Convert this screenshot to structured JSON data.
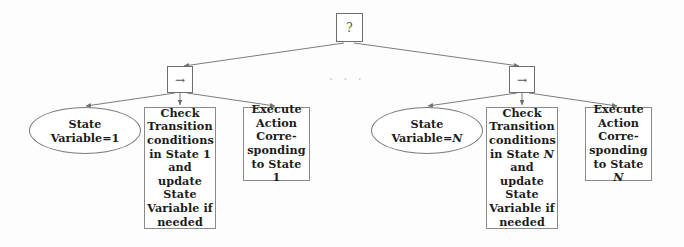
{
  "diagram": {
    "type": "behavior-tree",
    "background_color": "#fdfdfd",
    "line_color": "#6e6e6e",
    "text_color": "#1b1b1b",
    "ellipsis": "· · ·",
    "root": {
      "label": "?",
      "icon": "fallback-question-glyph"
    },
    "sequences": [
      {
        "label": "→",
        "icon": "sequence-arrow-glyph"
      },
      {
        "label": "→",
        "icon": "sequence-arrow-glyph"
      }
    ],
    "branches": [
      {
        "index": "1",
        "condition": {
          "line1": "State",
          "line2": "Variable=1"
        },
        "check": {
          "lines": [
            "Check",
            "Transition",
            "conditions",
            "in State 1",
            "and update",
            "State",
            "Variable if",
            "needed"
          ]
        },
        "execute": {
          "lines": [
            "Execute",
            "Action",
            "Corre-",
            "sponding",
            "to State 1"
          ]
        }
      },
      {
        "index": "N",
        "condition": {
          "line1": "State",
          "line2_prefix": "Variable=",
          "line2_var": "N"
        },
        "check": {
          "lines": [
            "Check",
            "Transition",
            "conditions",
            "in State",
            "and update",
            "State",
            "Variable if",
            "needed"
          ],
          "state_var": "N"
        },
        "execute": {
          "lines": [
            "Execute",
            "Action",
            "Corre-",
            "sponding",
            "to State"
          ],
          "state_var": "N"
        }
      }
    ]
  }
}
